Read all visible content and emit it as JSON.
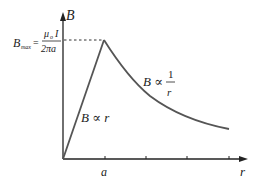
{
  "diagram": {
    "y_axis_label": "B",
    "x_axis_label": "r",
    "x_tick_label": "a",
    "bmax": {
      "symbol": "B",
      "subscript": "max",
      "equals": "=",
      "numerator": "μ₀I",
      "numerator_mu": "μ",
      "numerator_sub": "o",
      "numerator_I": "I",
      "denominator": "2πa"
    },
    "inside_relation": "B ∝ r",
    "outside_relation": {
      "lhs": "B ∝",
      "numerator": "1",
      "denominator": "r"
    },
    "colors": {
      "axis": "#222222",
      "curve": "#555555",
      "dashed": "#333333"
    }
  }
}
